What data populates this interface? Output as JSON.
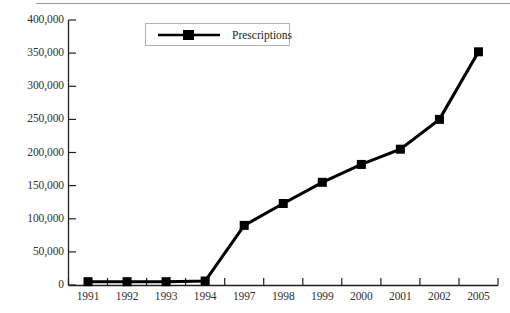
{
  "chart_data": {
    "type": "line",
    "title": "",
    "subtitle": "",
    "xlabel": "",
    "ylabel": "",
    "categories": [
      "1991",
      "1992",
      "1993",
      "1994",
      "1997",
      "1998",
      "1999",
      "2000",
      "2001",
      "2002",
      "2005"
    ],
    "series": [
      {
        "name": "Prescriptions",
        "values": [
          5000,
          5000,
          5000,
          6000,
          90000,
          123000,
          155000,
          182000,
          205000,
          250000,
          352000
        ],
        "color": "#000000",
        "marker": "square"
      }
    ],
    "ylim": [
      0,
      400000
    ],
    "y_ticks": [
      0,
      50000,
      100000,
      150000,
      200000,
      250000,
      300000,
      350000,
      400000
    ],
    "y_tick_labels": [
      "0",
      "50,000",
      "100,000",
      "150,000",
      "200,000",
      "250,000",
      "300,000",
      "350,000",
      "400,000"
    ],
    "grid": false,
    "legend_position": "top-center",
    "legend_entries": [
      "Prescriptions"
    ]
  },
  "legend": {
    "label": "Prescriptions",
    "swatch_icon": "line-with-square-marker-icon"
  },
  "colors": {
    "series": "#000000",
    "axis": "#231f20",
    "tick_text": "#33312f",
    "legend_border": "#b4b2b0",
    "top_rule": "#9a9a9e",
    "background": "#ffffff"
  }
}
